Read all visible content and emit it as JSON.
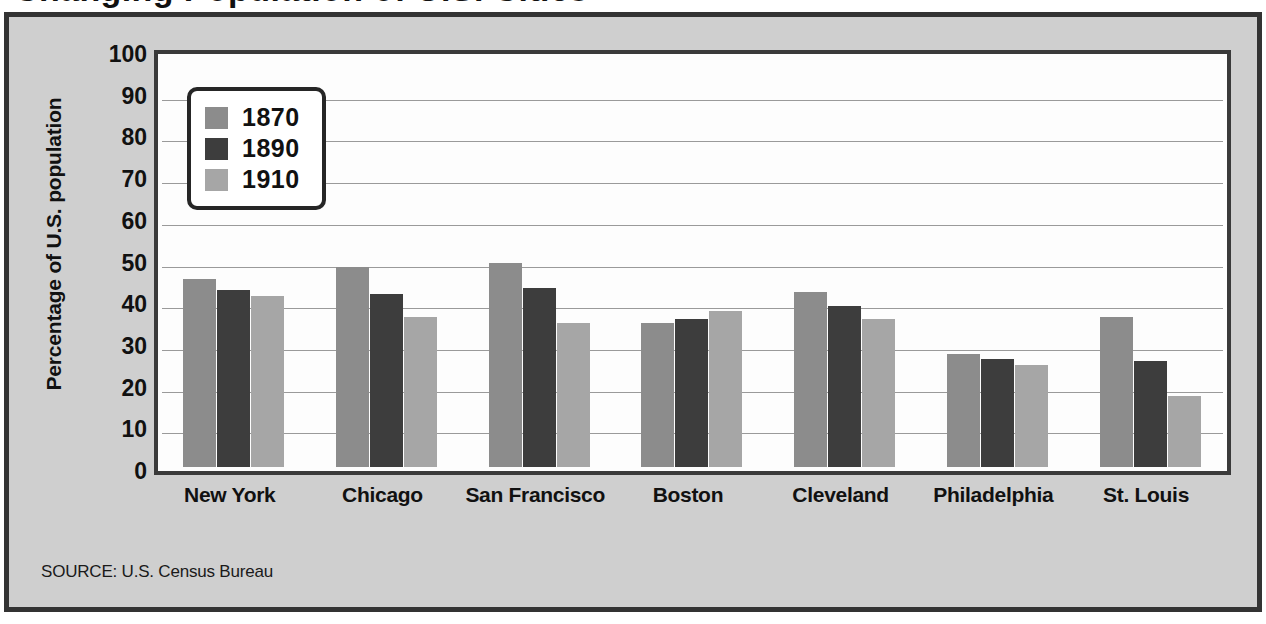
{
  "figure": {
    "title": "Changing Population of U.S. Cities",
    "source_note": "SOURCE: U.S. Census Bureau",
    "frame_color": "#333333",
    "panel_color": "#cfcfcf",
    "plot_bg_color": "#fdfdfd",
    "gridline_color": "#9a9a9a"
  },
  "legend": {
    "position": "top-left-inside",
    "items": [
      {
        "label": "1870",
        "color": "#8c8c8c"
      },
      {
        "label": "1890",
        "color": "#3d3d3d"
      },
      {
        "label": "1910",
        "color": "#a6a6a6"
      }
    ]
  },
  "chart_data": {
    "type": "bar",
    "title": "Changing Population of U.S. Cities",
    "xlabel": "",
    "ylabel": "Percentage of U.S. population",
    "ylim": [
      0,
      100
    ],
    "yticks": [
      0,
      10,
      20,
      30,
      40,
      50,
      60,
      70,
      80,
      90,
      100
    ],
    "ytick_labels": [
      "0",
      "10",
      "20",
      "30",
      "40",
      "50",
      "60",
      "70",
      "80",
      "90",
      "100"
    ],
    "grid": true,
    "legend_position": "upper left",
    "categories": [
      "New York",
      "Chicago",
      "San Francisco",
      "Boston",
      "Cleveland",
      "Philadelphia",
      "St. Louis"
    ],
    "series": [
      {
        "name": "1870",
        "color": "#8c8c8c",
        "values": [
          45,
          48,
          49,
          34.5,
          42,
          27,
          36
        ]
      },
      {
        "name": "1890",
        "color": "#3d3d3d",
        "values": [
          42.5,
          41.5,
          43,
          35.5,
          38.5,
          26,
          25.5
        ]
      },
      {
        "name": "1910",
        "color": "#a6a6a6",
        "values": [
          41,
          36,
          34.5,
          37.5,
          35.5,
          24.5,
          17
        ]
      }
    ]
  }
}
